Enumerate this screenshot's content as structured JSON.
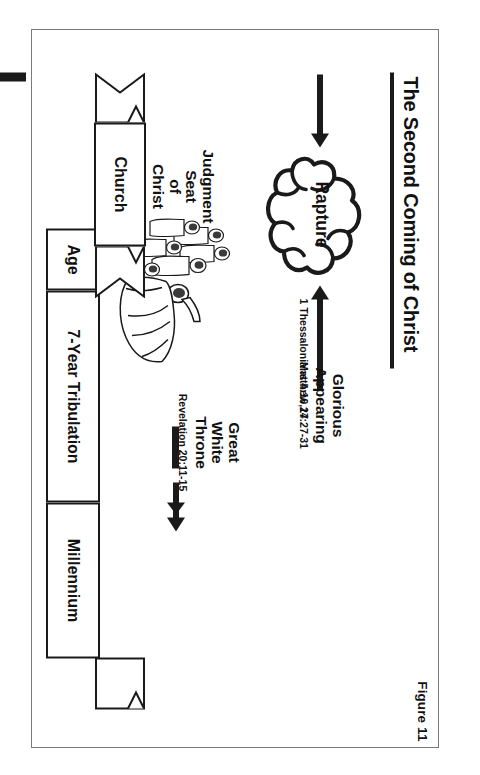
{
  "figure": {
    "label": "Figure 11",
    "title": "The Second Coming of Christ"
  },
  "blocks": {
    "rapture": {
      "label": "Rapture",
      "reference": "1 Thessalonians 4:16,17"
    },
    "judgment_seat": {
      "line1": "Judgment",
      "line2": "Seat",
      "line3": "of",
      "line4": "Christ",
      "reference": "1 Corinthians 3:9-15"
    },
    "great_white_throne": {
      "line1": "Great",
      "line2": "White",
      "line3": "Throne",
      "reference": "Revelation 20:11-15"
    },
    "glorious_appearing": {
      "line1": "Glorious",
      "line2": "Appearing",
      "reference": "Matthew 24:27-31"
    }
  },
  "timeline": {
    "church_banner": "Church",
    "segments": [
      {
        "label": "Age"
      },
      {
        "label": "7-Year Tribulation"
      },
      {
        "label": "Millennium"
      }
    ]
  },
  "icons": {
    "cloud": "cloud-icon",
    "cross": "cross-icon",
    "christ_crowd": "christ-with-crowd-illustration",
    "arrow_right": "arrow-right-icon",
    "arrow_left": "arrow-left-icon",
    "ribbon": "ribbon-tail-icon"
  },
  "colors": {
    "ink": "#1a1a1a",
    "paper": "#ffffff",
    "frame": "#7a7a7a"
  }
}
